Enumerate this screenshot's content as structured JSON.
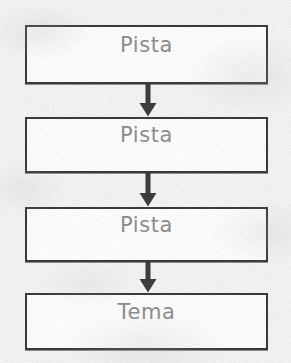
{
  "diagram": {
    "type": "vertical-flowchart",
    "orientation": "top-to-bottom",
    "background_color": "#f3f3f2",
    "box_fill_color": "#fdfdfd",
    "box_border_color": "#3a3a3c",
    "label_color": "#8d8d8d",
    "arrow_color": "#3d3d3f",
    "node_count": 4,
    "connector_count": 3,
    "nodes": [
      {
        "id": "flow-box-1",
        "label": "Pista"
      },
      {
        "id": "flow-box-2",
        "label": "Pista"
      },
      {
        "id": "flow-box-3",
        "label": "Pista"
      },
      {
        "id": "flow-box-4",
        "label": "Tema"
      }
    ],
    "connectors": [
      {
        "id": "flow-arrow-1",
        "icon": "arrow-down-icon",
        "from": "flow-box-1",
        "to": "flow-box-2"
      },
      {
        "id": "flow-arrow-2",
        "icon": "arrow-down-icon",
        "from": "flow-box-2",
        "to": "flow-box-3"
      },
      {
        "id": "flow-arrow-3",
        "icon": "arrow-down-icon",
        "from": "flow-box-3",
        "to": "flow-box-4"
      }
    ]
  }
}
